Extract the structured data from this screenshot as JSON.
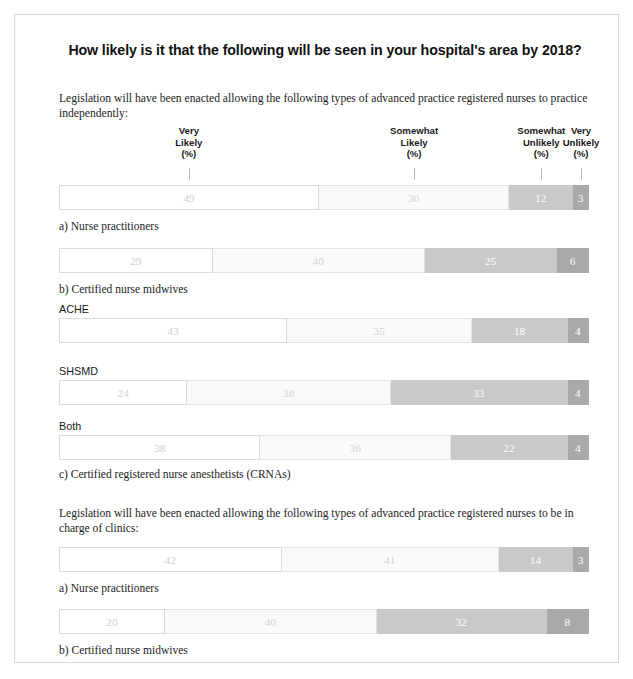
{
  "title": "How likely is it that the following will be seen in your hospital's area by 2018?",
  "sections": [
    {
      "intro": "Legislation will have been enacted allowing the following types of advanced practice registered nurses to practice independently:",
      "captions": [
        "a) Nurse practitioners",
        "b) Certified nurse midwives",
        "c) Certified registered nurse anesthetists (CRNAs)"
      ],
      "group_labels": [
        "ACHE",
        "SHSMD",
        "Both"
      ]
    },
    {
      "intro": "Legislation will have been enacted allowing the following types of advanced practice registered nurses to be in charge of clinics:",
      "captions": [
        "a) Nurse practitioners",
        "b) Certified nurse midwives"
      ]
    }
  ],
  "headers": [
    {
      "lines": [
        "Very",
        "Likely",
        "(%)"
      ]
    },
    {
      "lines": [
        "Somewhat",
        "Likely",
        "(%)"
      ]
    },
    {
      "lines": [
        "Somewhat",
        "Unlikely",
        "(%)"
      ]
    },
    {
      "lines": [
        "Very",
        "Unlikely",
        "(%)"
      ]
    }
  ],
  "colors": {
    "very_likely": "#ffffff",
    "somewhat_likely": "#fafafa",
    "somewhat_unlikely": "#c9c9c9",
    "very_unlikely": "#a9a9a9",
    "frame": "#d8d8d8"
  },
  "chart_data": {
    "type": "bar",
    "title": "How likely is it that the following will be seen in your hospital's area by 2018?",
    "xlabel": "",
    "ylabel": "",
    "xlim": [
      0,
      100
    ],
    "grid": false,
    "legend_position": "top",
    "orientation": "horizontal-stacked",
    "categories": [
      "a) Nurse practitioners (practice independently)",
      "b) Certified nurse midwives (practice independently)",
      "c) CRNAs (practice independently) - ACHE",
      "c) CRNAs (practice independently) - SHSMD",
      "c) CRNAs (practice independently) - Both",
      "a) Nurse practitioners (in charge of clinics)",
      "b) Certified nurse midwives (in charge of clinics)"
    ],
    "series": [
      {
        "name": "Very Likely (%)",
        "values": [
          49,
          29,
          43,
          24,
          38,
          42,
          20
        ]
      },
      {
        "name": "Somewhat Likely (%)",
        "values": [
          36,
          40,
          35,
          38,
          36,
          41,
          40
        ]
      },
      {
        "name": "Somewhat Unlikely (%)",
        "values": [
          12,
          25,
          18,
          33,
          22,
          14,
          32
        ]
      },
      {
        "name": "Very Unlikely (%)",
        "values": [
          3,
          6,
          4,
          4,
          4,
          3,
          8
        ]
      }
    ],
    "bars": [
      {
        "id": "bar-np-independent",
        "values": [
          49,
          36,
          12,
          3
        ]
      },
      {
        "id": "bar-cnm-independent",
        "values": [
          29,
          40,
          25,
          6
        ]
      },
      {
        "id": "bar-crna-ache",
        "values": [
          43,
          35,
          18,
          4
        ]
      },
      {
        "id": "bar-crna-shsmd",
        "values": [
          24,
          38,
          33,
          4
        ]
      },
      {
        "id": "bar-crna-both",
        "values": [
          38,
          36,
          22,
          4
        ]
      },
      {
        "id": "bar-np-clinics",
        "values": [
          42,
          41,
          14,
          3
        ]
      },
      {
        "id": "bar-cnm-clinics",
        "values": [
          20,
          40,
          32,
          8
        ]
      }
    ]
  }
}
